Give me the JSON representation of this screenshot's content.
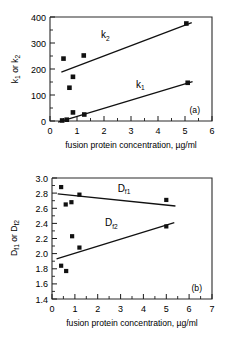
{
  "figure": {
    "background_color": "#ffffff",
    "ink_color": "#111111"
  },
  "chart_data": [
    {
      "type": "scatter",
      "panel_label": "(a)",
      "title": "",
      "xlabel": "fusion protein concentration, µg/ml",
      "ylabel": "k₁ or k₂",
      "ylabel_parts": {
        "main1": "k",
        "sub1": "1",
        "mid": " or ",
        "main2": "k",
        "sub2": "2"
      },
      "xlim": [
        0,
        6
      ],
      "ylim": [
        0,
        400
      ],
      "xticks": [
        0,
        1,
        2,
        3,
        4,
        5,
        6
      ],
      "yticks": [
        0,
        100,
        200,
        300,
        400
      ],
      "xticklabels": [
        "0",
        "1",
        "2",
        "3",
        "4",
        "5",
        "6"
      ],
      "yticklabels": [
        "0",
        "100",
        "200",
        "300",
        "400"
      ],
      "grid": false,
      "legend": "inline-annotations",
      "series": [
        {
          "name": "k2",
          "label": "k₂",
          "label_main": "k",
          "label_sub": "2",
          "label_x": 2.05,
          "label_y": 318,
          "marker": "square",
          "points": [
            {
              "x": 0.5,
              "y": 240
            },
            {
              "x": 0.72,
              "y": 128
            },
            {
              "x": 0.85,
              "y": 170
            },
            {
              "x": 1.25,
              "y": 252
            },
            {
              "x": 5.05,
              "y": 375
            }
          ],
          "fit_line": {
            "x0": 0.42,
            "y0": 188,
            "x1": 5.25,
            "y1": 378
          }
        },
        {
          "name": "k1",
          "label": "k₁",
          "label_main": "k",
          "label_sub": "1",
          "label_x": 3.35,
          "label_y": 128,
          "marker": "square",
          "points": [
            {
              "x": 0.45,
              "y": 2
            },
            {
              "x": 0.62,
              "y": 5
            },
            {
              "x": 0.85,
              "y": 33
            },
            {
              "x": 1.27,
              "y": 25
            },
            {
              "x": 5.1,
              "y": 147
            }
          ],
          "fit_line": {
            "x0": 0.3,
            "y0": -4,
            "x1": 5.28,
            "y1": 151
          }
        }
      ]
    },
    {
      "type": "scatter",
      "panel_label": "(b)",
      "title": "",
      "xlabel": "fusion protein concentration, µg/ml",
      "ylabel": "Dₑ₁ or Dₑ₂",
      "ylabel_parts": {
        "main1": "D",
        "sub1": "f1",
        "mid": " or ",
        "main2": "D",
        "sub2": "f2"
      },
      "xlim": [
        0,
        7
      ],
      "ylim": [
        1.4,
        3.0
      ],
      "xticks": [
        0,
        1,
        2,
        3,
        4,
        5,
        6,
        7
      ],
      "yticks": [
        1.4,
        1.6,
        1.8,
        2.0,
        2.2,
        2.4,
        2.6,
        2.8,
        3.0
      ],
      "xticklabels": [
        "0",
        "1",
        "2",
        "3",
        "4",
        "5",
        "6",
        "7"
      ],
      "yticklabels": [
        "1.4",
        "1.6",
        "1.8",
        "2.0",
        "2.2",
        "2.4",
        "2.6",
        "2.8",
        "3.0"
      ],
      "grid": false,
      "legend": "inline-annotations",
      "series": [
        {
          "name": "Df1",
          "label": "Df1",
          "label_main": "D",
          "label_sub": "f1",
          "label_x": 3.15,
          "label_y": 2.82,
          "marker": "square",
          "points": [
            {
              "x": 0.4,
              "y": 2.88
            },
            {
              "x": 0.6,
              "y": 2.65
            },
            {
              "x": 0.85,
              "y": 2.68
            },
            {
              "x": 1.2,
              "y": 2.78
            },
            {
              "x": 5.0,
              "y": 2.71
            }
          ],
          "fit_line": {
            "x0": 0.25,
            "y0": 2.79,
            "x1": 5.4,
            "y1": 2.63
          }
        },
        {
          "name": "Df2",
          "label": "Df2",
          "label_main": "D",
          "label_sub": "f2",
          "label_x": 2.6,
          "label_y": 2.36,
          "marker": "square",
          "points": [
            {
              "x": 0.4,
              "y": 1.84
            },
            {
              "x": 0.62,
              "y": 1.77
            },
            {
              "x": 0.88,
              "y": 2.23
            },
            {
              "x": 1.2,
              "y": 2.08
            },
            {
              "x": 5.0,
              "y": 2.36
            }
          ],
          "fit_line": {
            "x0": 0.2,
            "y0": 1.93,
            "x1": 5.35,
            "y1": 2.41
          }
        }
      ]
    }
  ]
}
